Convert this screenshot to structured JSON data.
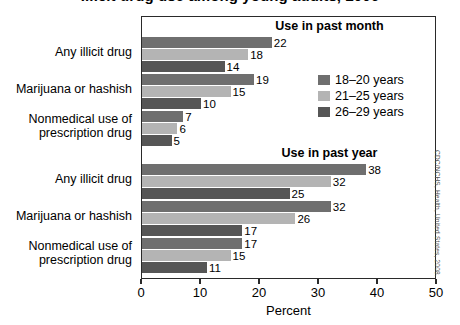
{
  "figure": {
    "title": "Illicit drug use among young adults, 2006",
    "source_credit": "CDC/NCHS, Health, United States, 2008."
  },
  "legend": {
    "position": "inside-upper-right",
    "entries": [
      {
        "label": "18–20 years",
        "color": "#6f6f6f"
      },
      {
        "label": "21–25 years",
        "color": "#b4b4b4"
      },
      {
        "label": "26–29 years",
        "color": "#565656"
      }
    ]
  },
  "axis": {
    "x_title": "Percent",
    "ticks": [
      "0",
      "10",
      "20",
      "30",
      "40",
      "50"
    ]
  },
  "chart_data": {
    "type": "bar",
    "orientation": "horizontal",
    "title": "Illicit drug use among young adults, 2006",
    "xlabel": "Percent",
    "ylabel": "",
    "xlim": [
      0,
      50
    ],
    "xticks": [
      0,
      10,
      20,
      30,
      40,
      50
    ],
    "grid": false,
    "legend_position": "inside upper right",
    "series": [
      {
        "name": "18–20 years",
        "color": "#6f6f6f"
      },
      {
        "name": "21–25 years",
        "color": "#b4b4b4"
      },
      {
        "name": "26–29 years",
        "color": "#565656"
      }
    ],
    "panels": [
      {
        "header": "Use in past month",
        "categories": [
          "Any illicit drug",
          "Marijuana or hashish",
          "Nonmedical use of prescription drug"
        ],
        "values": {
          "18–20 years": [
            22,
            19,
            7
          ],
          "21–25 years": [
            18,
            15,
            6
          ],
          "26–29 years": [
            14,
            10,
            5
          ]
        }
      },
      {
        "header": "Use in past year",
        "categories": [
          "Any illicit drug",
          "Marijuana or hashish",
          "Nonmedical use of prescription drug"
        ],
        "values": {
          "18–20 years": [
            38,
            32,
            17
          ],
          "21–25 years": [
            32,
            26,
            15
          ],
          "26–29 years": [
            25,
            17,
            11
          ]
        }
      }
    ]
  }
}
